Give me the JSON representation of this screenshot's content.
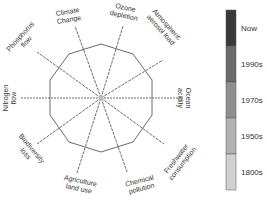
{
  "diagram": {
    "type": "radar",
    "center": [
      101,
      98
    ],
    "boundary_polygon_sides": 10,
    "axes": [
      {
        "label_lines": [
          "Climate",
          "Change"
        ],
        "end": [
          75,
          26
        ],
        "label_pos": [
          68,
          14
        ],
        "rotate": -10
      },
      {
        "label_lines": [
          "Ozone",
          "depletion"
        ],
        "end": [
          123,
          26
        ],
        "label_pos": [
          125,
          10
        ],
        "rotate": 12
      },
      {
        "label_lines": [
          "Atmospheric",
          "aerosol load"
        ],
        "end": [
          163,
          60
        ],
        "label_pos": [
          165,
          26
        ],
        "rotate": 48
      },
      {
        "label_lines": [
          "Ocean",
          "acidity"
        ],
        "end": [
          183,
          98
        ],
        "label_pos": [
          186,
          98
        ],
        "rotate": 90
      },
      {
        "label_lines": [
          "Freshwater",
          "consumption"
        ],
        "end": [
          164,
          144
        ],
        "label_pos": [
          178,
          160
        ],
        "rotate": -52
      },
      {
        "label_lines": [
          "Chemical",
          "pollution"
        ],
        "end": [
          127,
          172
        ],
        "label_pos": [
          140,
          183
        ],
        "rotate": -15
      },
      {
        "label_lines": [
          "Agriculture",
          "land use"
        ],
        "end": [
          77,
          173
        ],
        "label_pos": [
          80,
          183
        ],
        "rotate": 12
      },
      {
        "label_lines": [
          "Biodiversity",
          "loss"
        ],
        "end": [
          37,
          144
        ],
        "label_pos": [
          30,
          150
        ],
        "rotate": 50
      },
      {
        "label_lines": [
          "Nitrogen",
          "flow"
        ],
        "end": [
          20,
          98
        ],
        "label_pos": [
          8,
          98
        ],
        "rotate": -90
      },
      {
        "label_lines": [
          "Phosphorus",
          "flow"
        ],
        "end": [
          37,
          52
        ],
        "label_pos": [
          22,
          38
        ],
        "rotate": -48
      }
    ],
    "legend": {
      "items": [
        {
          "label": "Now",
          "color": "#3a3a3a"
        },
        {
          "label": "1990s",
          "color": "#6b6b6b"
        },
        {
          "label": "1970s",
          "color": "#8f8f8f"
        },
        {
          "label": "1950s",
          "color": "#b2b2b2"
        },
        {
          "label": "1800s",
          "color": "#d0d0d0"
        }
      ]
    },
    "colors": {
      "axis": "#6a6a6a",
      "polygon": "#6a6a6a",
      "text": "#333333"
    }
  }
}
